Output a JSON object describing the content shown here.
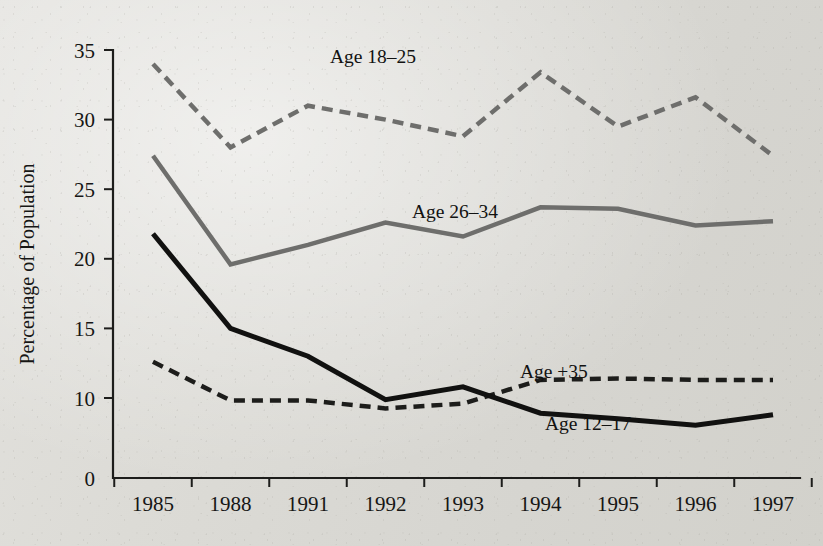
{
  "figure": {
    "background_color": "#dcdbd6",
    "ink_color": "#1d1d1b"
  },
  "axes": {
    "y_axis_title": "Percentage of Population",
    "y_ticks": [
      "35",
      "30",
      "25",
      "20",
      "15",
      "10",
      "0"
    ],
    "x_ticks": [
      "1985",
      "1988",
      "1991",
      "1992",
      "1993",
      "1994",
      "1995",
      "1996",
      "1997"
    ]
  },
  "annotations": [
    {
      "id": "label-age-18-25",
      "text": "Age 18–25"
    },
    {
      "id": "label-age-26-34",
      "text": "Age 26–34"
    },
    {
      "id": "label-age-plus-35",
      "text": "Age +35"
    },
    {
      "id": "label-age-12-17",
      "text": "Age 12–17"
    }
  ],
  "chart_data": {
    "type": "line",
    "title": "",
    "xlabel": "",
    "ylabel": "Percentage of Population",
    "x": [
      "1985",
      "1988",
      "1991",
      "1992",
      "1993",
      "1994",
      "1995",
      "1996",
      "1997"
    ],
    "ylim": [
      0,
      35
    ],
    "y_ticks": [
      0,
      10,
      15,
      20,
      25,
      30,
      35
    ],
    "y_axis_break_between": [
      0,
      10
    ],
    "grid": false,
    "legend": "inline-annotations",
    "series": [
      {
        "name": "Age 18–25",
        "color": "#6e6e6c",
        "style": "dashed",
        "width": 4.5,
        "values": [
          34.0,
          28.0,
          31.0,
          30.0,
          28.8,
          33.4,
          29.5,
          31.6,
          27.4
        ]
      },
      {
        "name": "Age 26–34",
        "color": "#6e6e6c",
        "style": "solid",
        "width": 4.5,
        "values": [
          27.4,
          19.6,
          21.0,
          22.6,
          21.6,
          23.7,
          23.6,
          22.4,
          22.7
        ]
      },
      {
        "name": "Age +35",
        "color": "#1d1d1b",
        "style": "dashed",
        "width": 4.5,
        "values": [
          12.6,
          9.7,
          9.7,
          8.7,
          9.3,
          11.3,
          11.4,
          11.3,
          11.3
        ]
      },
      {
        "name": "Age 12–17",
        "color": "#111110",
        "style": "solid",
        "width": 5.0,
        "values": [
          21.8,
          15.0,
          13.0,
          9.8,
          10.8,
          8.1,
          7.4,
          6.6,
          7.9
        ]
      }
    ]
  },
  "geometry": {
    "plot_left": 113,
    "plot_right": 800,
    "plot_bottom": 478,
    "y_top_value": 35,
    "y_top_px": 50,
    "y_ten_px": 398,
    "x_first_px": 153,
    "x_step_px": 77.5,
    "label_positions": [
      {
        "id": "label-age-18-25",
        "x": 330,
        "y": 63
      },
      {
        "id": "label-age-26-34",
        "x": 412,
        "y": 218
      },
      {
        "id": "label-age-plus-35",
        "x": 520,
        "y": 378
      },
      {
        "id": "label-age-12-17",
        "x": 545,
        "y": 430
      }
    ]
  }
}
